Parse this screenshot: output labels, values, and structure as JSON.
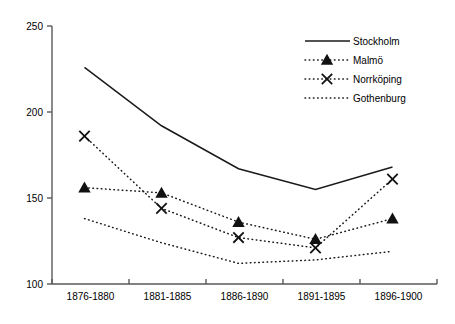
{
  "chart_data": {
    "type": "line",
    "title": "",
    "xlabel": "",
    "ylabel": "",
    "categories": [
      "1876-1880",
      "1881-1885",
      "1886-1890",
      "1891-1895",
      "1896-1900"
    ],
    "ylim": [
      100,
      250
    ],
    "yticks": [
      100,
      150,
      200,
      250
    ],
    "ytick_labels": [
      "100",
      "150",
      "200",
      "250"
    ],
    "grid": false,
    "legend_position": "top-right",
    "series": [
      {
        "name": "Stockholm",
        "style": "solid",
        "marker": "none",
        "color": "#1a1a1a",
        "values": [
          226,
          192,
          167,
          155,
          168
        ]
      },
      {
        "name": "Malmö",
        "style": "dotted",
        "marker": "triangle",
        "color": "#111111",
        "values": [
          156,
          153,
          136,
          126,
          138
        ]
      },
      {
        "name": "Norrköping",
        "style": "dotted",
        "marker": "x",
        "color": "#111111",
        "values": [
          186,
          144,
          127,
          121,
          161
        ]
      },
      {
        "name": "Gothenburg",
        "style": "dotted",
        "marker": "none",
        "color": "#111111",
        "values": [
          138,
          124,
          112,
          114,
          119
        ]
      }
    ]
  },
  "legend": {
    "items": [
      {
        "label": "Stockholm"
      },
      {
        "label": "Malmö"
      },
      {
        "label": "Norrköping"
      },
      {
        "label": "Gothenburg"
      }
    ]
  },
  "axes": {
    "y_tick_labels": [
      "250",
      "200",
      "150",
      "100"
    ],
    "x_tick_labels": [
      "1876-1880",
      "1881-1885",
      "1886-1890",
      "1891-1895",
      "1896-1900"
    ]
  }
}
